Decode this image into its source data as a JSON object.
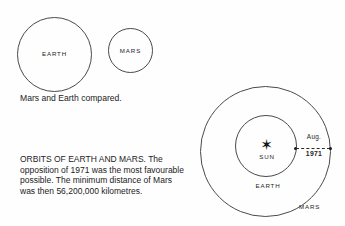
{
  "figure": {
    "comparison": {
      "earth_label": "EARTH",
      "mars_label": "MARS",
      "caption": "Mars and Earth compared."
    },
    "orbits": {
      "sun_label": "SUN",
      "sun_icon": "sun-starburst-icon",
      "earth_orbit_label": "EARTH",
      "mars_orbit_label": "MARS",
      "opposition_month": "Aug.",
      "opposition_year": "1971",
      "paragraph": "ORBITS OF EARTH AND MARS. The opposition of 1971 was the most favourable possible. The minimum distance of Mars was then 56,200,000 kilometres."
    }
  },
  "colors": {
    "page_background": "#fefefe",
    "line": "#4a4a4a",
    "text": "#232323",
    "label_text": "#1f1f1f"
  }
}
